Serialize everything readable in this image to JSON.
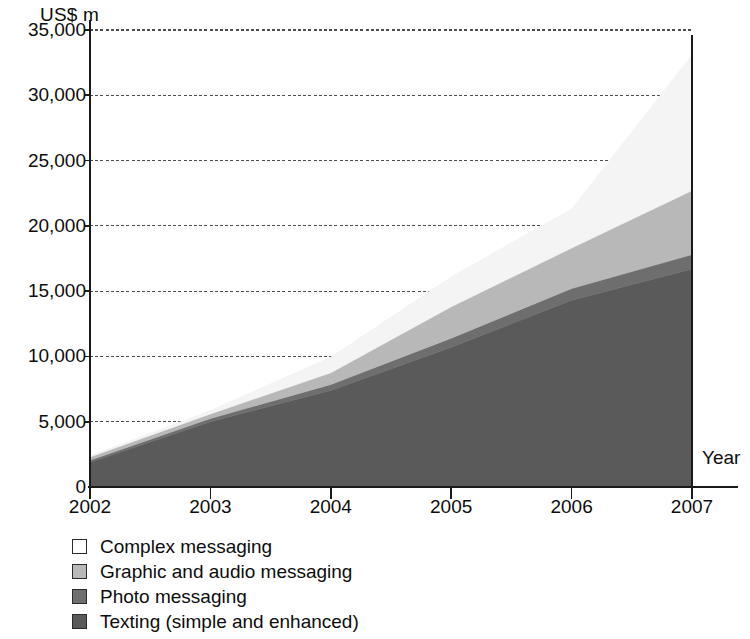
{
  "chart_data": {
    "type": "area",
    "stacked": true,
    "title": "",
    "subtitle": "",
    "xlabel": "Year",
    "ylabel": "US$ m",
    "x": [
      2002,
      2003,
      2004,
      2005,
      2006,
      2007
    ],
    "categories": [
      "2002",
      "2003",
      "2004",
      "2005",
      "2006",
      "2007"
    ],
    "xtick_labels": [
      "2002",
      "2003",
      "2004",
      "2005",
      "2006",
      "2007"
    ],
    "ytick_labels": [
      "0",
      "5,000",
      "10,000",
      "15,000",
      "20,000",
      "25,000",
      "30,000",
      "35,000"
    ],
    "ytick_values": [
      0,
      5000,
      10000,
      15000,
      20000,
      25000,
      30000,
      35000
    ],
    "ylim": [
      0,
      35000
    ],
    "xlim": [
      2002,
      2007
    ],
    "grid": "horizontal",
    "legend_position": "below",
    "series": [
      {
        "name": "Texting (simple and enhanced)",
        "color": "#5a5a5a",
        "swatch": "#5a5a5a",
        "values": [
          1900,
          5000,
          7400,
          10700,
          14300,
          16700
        ]
      },
      {
        "name": "Photo messaging",
        "color": "#6e6e6e",
        "swatch": "#6e6e6e",
        "values": [
          150,
          250,
          450,
          700,
          900,
          1100
        ]
      },
      {
        "name": "Graphic and audio messaging",
        "color": "#b8b8b8",
        "swatch": "#b8b8b8",
        "values": [
          250,
          350,
          900,
          2400,
          3100,
          4900
        ]
      },
      {
        "name": "Complex messaging",
        "color": "#f4f4f4",
        "swatch": "#fdfdfd",
        "values": [
          100,
          250,
          1200,
          2300,
          3000,
          10400
        ]
      }
    ],
    "totals": [
      2400,
      5850,
      9950,
      16100,
      21300,
      33100
    ],
    "annotations": []
  },
  "legend": {
    "items": [
      {
        "label": "Complex messaging",
        "swatch": "#fdfdfd"
      },
      {
        "label": "Graphic and audio messaging",
        "swatch": "#b8b8b8"
      },
      {
        "label": "Photo messaging",
        "swatch": "#6e6e6e"
      },
      {
        "label": "Texting (simple and enhanced)",
        "swatch": "#5a5a5a"
      }
    ]
  },
  "axes": {
    "y_unit_label": "US$ m",
    "x_axis_title": "Year"
  },
  "colors": {
    "axis": "#1a1a1a",
    "gridline": "#4d4d4d",
    "background": "#ffffff",
    "text": "#0d0d0d"
  }
}
